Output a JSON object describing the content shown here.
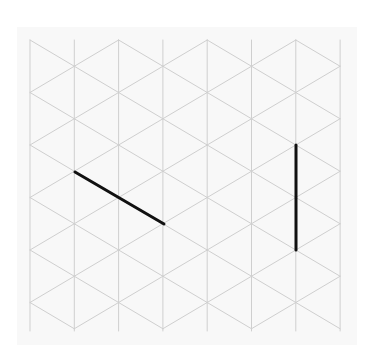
{
  "diagram": {
    "type": "isometric-grid",
    "panel_color": "#f8f8f8",
    "grid_color": "#cfcfcf",
    "stroke_color": "#111111",
    "grid": {
      "columns": 8,
      "x_start": 30,
      "col_spacing": 44.3,
      "y_top": 40,
      "y_bottom": 331,
      "row_spacing": 52.5
    },
    "segments": [
      {
        "id": "diagonal-segment",
        "x1": 75,
        "y1": 172,
        "x2": 164,
        "y2": 224
      },
      {
        "id": "vertical-segment",
        "x1": 296,
        "y1": 145,
        "x2": 296,
        "y2": 250
      }
    ]
  }
}
